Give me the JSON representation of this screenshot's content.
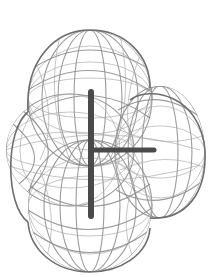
{
  "image": {
    "description": "Wireframe molecular surface enclosing a T-shaped molecule",
    "width": 212,
    "height": 277,
    "background_color": "#ffffff",
    "mesh_color": "#8a8a8a",
    "bond_color": "#4a4a4a"
  },
  "molecule": {
    "shape": "T-shaped",
    "lobes": [
      {
        "name": "top",
        "cx": 90,
        "cy": 98,
        "rx": 62,
        "ry": 68
      },
      {
        "name": "right",
        "cx": 160,
        "cy": 152,
        "rx": 45,
        "ry": 66
      },
      {
        "name": "bottom",
        "cx": 90,
        "cy": 206,
        "rx": 62,
        "ry": 66
      },
      {
        "name": "left-center",
        "cx": 70,
        "cy": 150,
        "rx": 64,
        "ry": 56
      }
    ],
    "bonds": [
      {
        "name": "vertical-bond",
        "x1": 91,
        "y1": 92,
        "x2": 91,
        "y2": 216,
        "width": 6
      },
      {
        "name": "horizontal-bond",
        "x1": 93,
        "y1": 150,
        "x2": 154,
        "y2": 150,
        "width": 5
      }
    ]
  }
}
